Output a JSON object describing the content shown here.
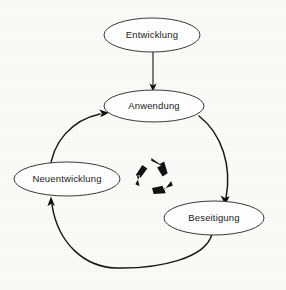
{
  "figure": {
    "type": "cycle-diagram",
    "background_color": "#fbfbf9",
    "line_color": "#1a1a1a",
    "text_color": "#1b1b1b"
  },
  "nodes": [
    {
      "id": "entwicklung",
      "label": "Entwicklung",
      "cx": 152,
      "cy": 35,
      "rx": 48,
      "ry": 17
    },
    {
      "id": "anwendung",
      "label": "Anwendung",
      "cx": 154,
      "cy": 106,
      "rx": 50,
      "ry": 16
    },
    {
      "id": "neuentwicklung",
      "label": "Neuentwicklung",
      "cx": 67,
      "cy": 179,
      "rx": 53,
      "ry": 17
    },
    {
      "id": "beseitigung",
      "label": "Beseitigung",
      "cx": 214,
      "cy": 218,
      "rx": 50,
      "ry": 17
    }
  ],
  "edges": [
    {
      "id": "entwicklung-to-anwendung",
      "from": "Entwicklung",
      "to": "Anwendung",
      "style": "straight",
      "direction": "down"
    },
    {
      "id": "anwendung-to-beseitigung",
      "from": "Anwendung",
      "to": "Beseitigung",
      "style": "curve",
      "direction": "down-right"
    },
    {
      "id": "beseitigung-to-neuentwicklung",
      "from": "Beseitigung",
      "to": "Neuentwicklung",
      "style": "curve",
      "direction": "left-up"
    },
    {
      "id": "neuentwicklung-to-anwendung",
      "from": "Neuentwicklung",
      "to": "Anwendung",
      "style": "curve",
      "direction": "up-right"
    }
  ],
  "center_symbol": {
    "id": "recycle-symbol",
    "name": "recycle-icon",
    "label": "Recycling",
    "cx": 154,
    "cy": 176,
    "size": 37
  }
}
